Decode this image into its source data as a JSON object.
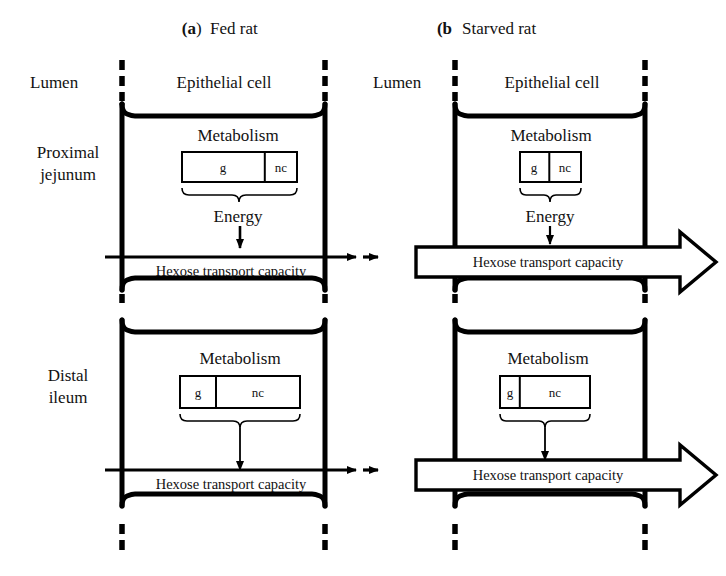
{
  "figure": {
    "type": "diagram",
    "background_color": "#ffffff",
    "line_color": "#000000"
  },
  "panels": [
    {
      "id": "a",
      "letter": "(a",
      "letter_close": ")",
      "title": "Fed rat",
      "lumen_label": "Lumen",
      "cell_label": "Epithelial cell",
      "regions": [
        {
          "id": "proximal-fed",
          "side_label_line1": "Proximal",
          "side_label_line2": "jejunum",
          "metabolism_label": "Metabolism",
          "substrate_boxes": [
            {
              "label": "g",
              "fraction": 0.72
            },
            {
              "label": "nc",
              "fraction": 0.28
            }
          ],
          "energy_label": "Energy",
          "transport_label": "Hexose transport capacity",
          "transport_arrow_style": "thin",
          "transport_magnitude": "normal"
        },
        {
          "id": "distal-fed",
          "side_label_line1": "Distal",
          "side_label_line2": "ileum",
          "metabolism_label": "Metabolism",
          "substrate_boxes": [
            {
              "label": "g",
              "fraction": 0.3
            },
            {
              "label": "nc",
              "fraction": 0.7
            }
          ],
          "energy_label": "",
          "transport_label": "Hexose transport capacity",
          "transport_arrow_style": "thin",
          "transport_magnitude": "normal"
        }
      ]
    },
    {
      "id": "b",
      "letter": "(b",
      "letter_close": "",
      "title": "Starved rat",
      "lumen_label": "Lumen",
      "cell_label": "Epithelial cell",
      "regions": [
        {
          "id": "proximal-starved",
          "side_label_line1": "",
          "side_label_line2": "",
          "metabolism_label": "Metabolism",
          "substrate_boxes": [
            {
              "label": "g",
              "fraction": 0.48
            },
            {
              "label": "nc",
              "fraction": 0.52
            }
          ],
          "energy_label": "Energy",
          "transport_label": "Hexose transport capacity",
          "transport_arrow_style": "thick-hollow",
          "transport_magnitude": "increased"
        },
        {
          "id": "distal-starved",
          "side_label_line1": "",
          "side_label_line2": "",
          "metabolism_label": "Metabolism",
          "substrate_boxes": [
            {
              "label": "g",
              "fraction": 0.22
            },
            {
              "label": "nc",
              "fraction": 0.78
            }
          ],
          "energy_label": "",
          "transport_label": "Hexose transport capacity",
          "transport_arrow_style": "thick-hollow",
          "transport_magnitude": "increased"
        }
      ]
    }
  ],
  "legend_keys": {
    "g": "glucose",
    "nc": "non-carbohydrate"
  }
}
